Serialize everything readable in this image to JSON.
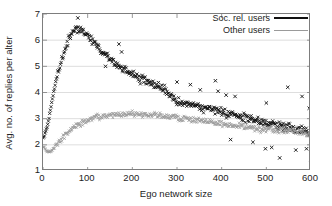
{
  "chart_data": {
    "type": "scatter",
    "title": "",
    "xlabel": "Ego network size",
    "ylabel": "Avg. no. of replies per alter",
    "xlim": [
      0,
      600
    ],
    "ylim": [
      1,
      7
    ],
    "xticks": [
      0,
      100,
      200,
      300,
      400,
      500,
      600
    ],
    "yticks": [
      1,
      2,
      3,
      4,
      5,
      6,
      7
    ],
    "grid": "horizontal",
    "legend_position": "top-right",
    "colors": {
      "soc_rel_users": "#111111",
      "other_users": "#9a9a9a",
      "axis": "#7d7d7d",
      "grid": "#d0d0d0",
      "background": "#ffffff"
    },
    "series": [
      {
        "name": "Soc. rel. users",
        "marker": "x",
        "color": "#111111",
        "x": [
          3,
          8,
          13,
          18,
          23,
          28,
          33,
          38,
          43,
          48,
          53,
          58,
          63,
          68,
          73,
          78,
          83,
          88,
          93,
          98,
          103,
          108,
          113,
          118,
          123,
          128,
          133,
          138,
          143,
          148,
          153,
          158,
          163,
          168,
          173,
          178,
          183,
          188,
          193,
          198,
          206,
          214,
          222,
          230,
          238,
          246,
          254,
          262,
          270,
          278,
          286,
          294,
          302,
          310,
          318,
          326,
          334,
          342,
          350,
          358,
          366,
          374,
          382,
          390,
          398,
          406,
          414,
          422,
          430,
          438,
          446,
          454,
          462,
          470,
          478,
          486,
          494,
          502,
          510,
          518,
          526,
          534,
          542,
          550,
          558,
          566,
          574,
          582,
          590,
          598
        ],
        "y": [
          2.35,
          2.55,
          2.95,
          3.45,
          3.95,
          4.35,
          4.7,
          5.0,
          5.3,
          5.55,
          5.8,
          6.0,
          6.2,
          6.35,
          6.45,
          6.4,
          6.35,
          6.3,
          6.25,
          6.2,
          6.15,
          6.05,
          5.95,
          5.85,
          5.75,
          5.65,
          5.55,
          5.45,
          5.4,
          5.3,
          5.25,
          5.15,
          5.1,
          5.0,
          4.95,
          4.9,
          4.85,
          4.8,
          4.75,
          4.7,
          4.6,
          4.55,
          4.5,
          4.45,
          4.4,
          4.3,
          4.25,
          4.2,
          4.1,
          4.0,
          3.9,
          3.8,
          3.7,
          3.65,
          3.6,
          3.55,
          3.5,
          3.45,
          3.45,
          3.4,
          3.4,
          3.35,
          3.35,
          3.3,
          3.3,
          3.25,
          3.2,
          3.2,
          3.15,
          3.1,
          3.05,
          3.0,
          3.0,
          2.95,
          2.9,
          2.9,
          2.85,
          2.85,
          2.8,
          2.8,
          2.75,
          2.75,
          2.7,
          2.7,
          2.65,
          2.6,
          2.6,
          2.55,
          2.5,
          2.4
        ]
      },
      {
        "name": "Other users",
        "marker": "x",
        "color": "#9a9a9a",
        "x": [
          3,
          8,
          13,
          18,
          23,
          28,
          33,
          38,
          43,
          48,
          53,
          58,
          63,
          68,
          73,
          78,
          83,
          88,
          93,
          98,
          103,
          108,
          113,
          118,
          123,
          128,
          133,
          138,
          143,
          148,
          153,
          158,
          163,
          168,
          173,
          178,
          183,
          188,
          193,
          198,
          206,
          214,
          222,
          230,
          238,
          246,
          254,
          262,
          270,
          278,
          286,
          294,
          302,
          310,
          318,
          326,
          334,
          342,
          350,
          358,
          366,
          374,
          382,
          390,
          398,
          406,
          414,
          422,
          430,
          438,
          446,
          454,
          462,
          470,
          478,
          486,
          494,
          502,
          510,
          518,
          526,
          534,
          542,
          550,
          558,
          566,
          574,
          582,
          590,
          598
        ],
        "y": [
          1.9,
          1.78,
          1.72,
          1.75,
          1.85,
          1.95,
          2.05,
          2.15,
          2.25,
          2.35,
          2.45,
          2.5,
          2.6,
          2.65,
          2.7,
          2.75,
          2.8,
          2.85,
          2.88,
          2.92,
          2.95,
          2.98,
          3.0,
          3.02,
          3.05,
          3.06,
          3.08,
          3.1,
          3.1,
          3.12,
          3.13,
          3.14,
          3.15,
          3.15,
          3.16,
          3.16,
          3.17,
          3.17,
          3.18,
          3.18,
          3.18,
          3.17,
          3.17,
          3.16,
          3.15,
          3.14,
          3.13,
          3.12,
          3.1,
          3.09,
          3.07,
          3.05,
          3.03,
          3.01,
          3.0,
          2.98,
          2.96,
          2.94,
          2.92,
          2.9,
          2.88,
          2.86,
          2.84,
          2.82,
          2.8,
          2.78,
          2.77,
          2.75,
          2.73,
          2.72,
          2.7,
          2.68,
          2.67,
          2.65,
          2.64,
          2.62,
          2.6,
          2.6,
          2.58,
          2.57,
          2.56,
          2.55,
          2.54,
          2.53,
          2.52,
          2.5,
          2.5,
          2.48,
          2.46,
          2.4
        ]
      }
    ],
    "outliers_high": [
      {
        "x": 78,
        "y": 6.85
      },
      {
        "x": 140,
        "y": 5.0
      },
      {
        "x": 170,
        "y": 5.85
      },
      {
        "x": 176,
        "y": 5.55
      },
      {
        "x": 300,
        "y": 4.4
      },
      {
        "x": 330,
        "y": 4.3
      },
      {
        "x": 352,
        "y": 4.1
      },
      {
        "x": 386,
        "y": 4.45
      },
      {
        "x": 392,
        "y": 4.05
      },
      {
        "x": 410,
        "y": 3.9
      },
      {
        "x": 430,
        "y": 3.85
      },
      {
        "x": 500,
        "y": 3.6
      },
      {
        "x": 548,
        "y": 4.2
      },
      {
        "x": 580,
        "y": 3.85
      },
      {
        "x": 596,
        "y": 3.4
      }
    ],
    "outliers_low": [
      {
        "x": 420,
        "y": 2.2
      },
      {
        "x": 470,
        "y": 2.1
      },
      {
        "x": 498,
        "y": 1.85
      },
      {
        "x": 512,
        "y": 1.9
      },
      {
        "x": 530,
        "y": 1.5
      },
      {
        "x": 566,
        "y": 1.8
      },
      {
        "x": 590,
        "y": 1.85
      },
      {
        "x": 600,
        "y": 1.3
      }
    ]
  },
  "axes": {
    "xlabel": "Ego network size",
    "ylabel": "Avg. no. of replies per alter",
    "xticks": [
      "0",
      "100",
      "200",
      "300",
      "400",
      "500",
      "600"
    ],
    "yticks": [
      "7",
      "6",
      "5",
      "4",
      "3",
      "2",
      "1"
    ]
  },
  "legend": {
    "entries": [
      {
        "label": "Soc. rel. users",
        "style": "black-solid"
      },
      {
        "label": "Other users",
        "style": "gray-solid"
      }
    ]
  }
}
